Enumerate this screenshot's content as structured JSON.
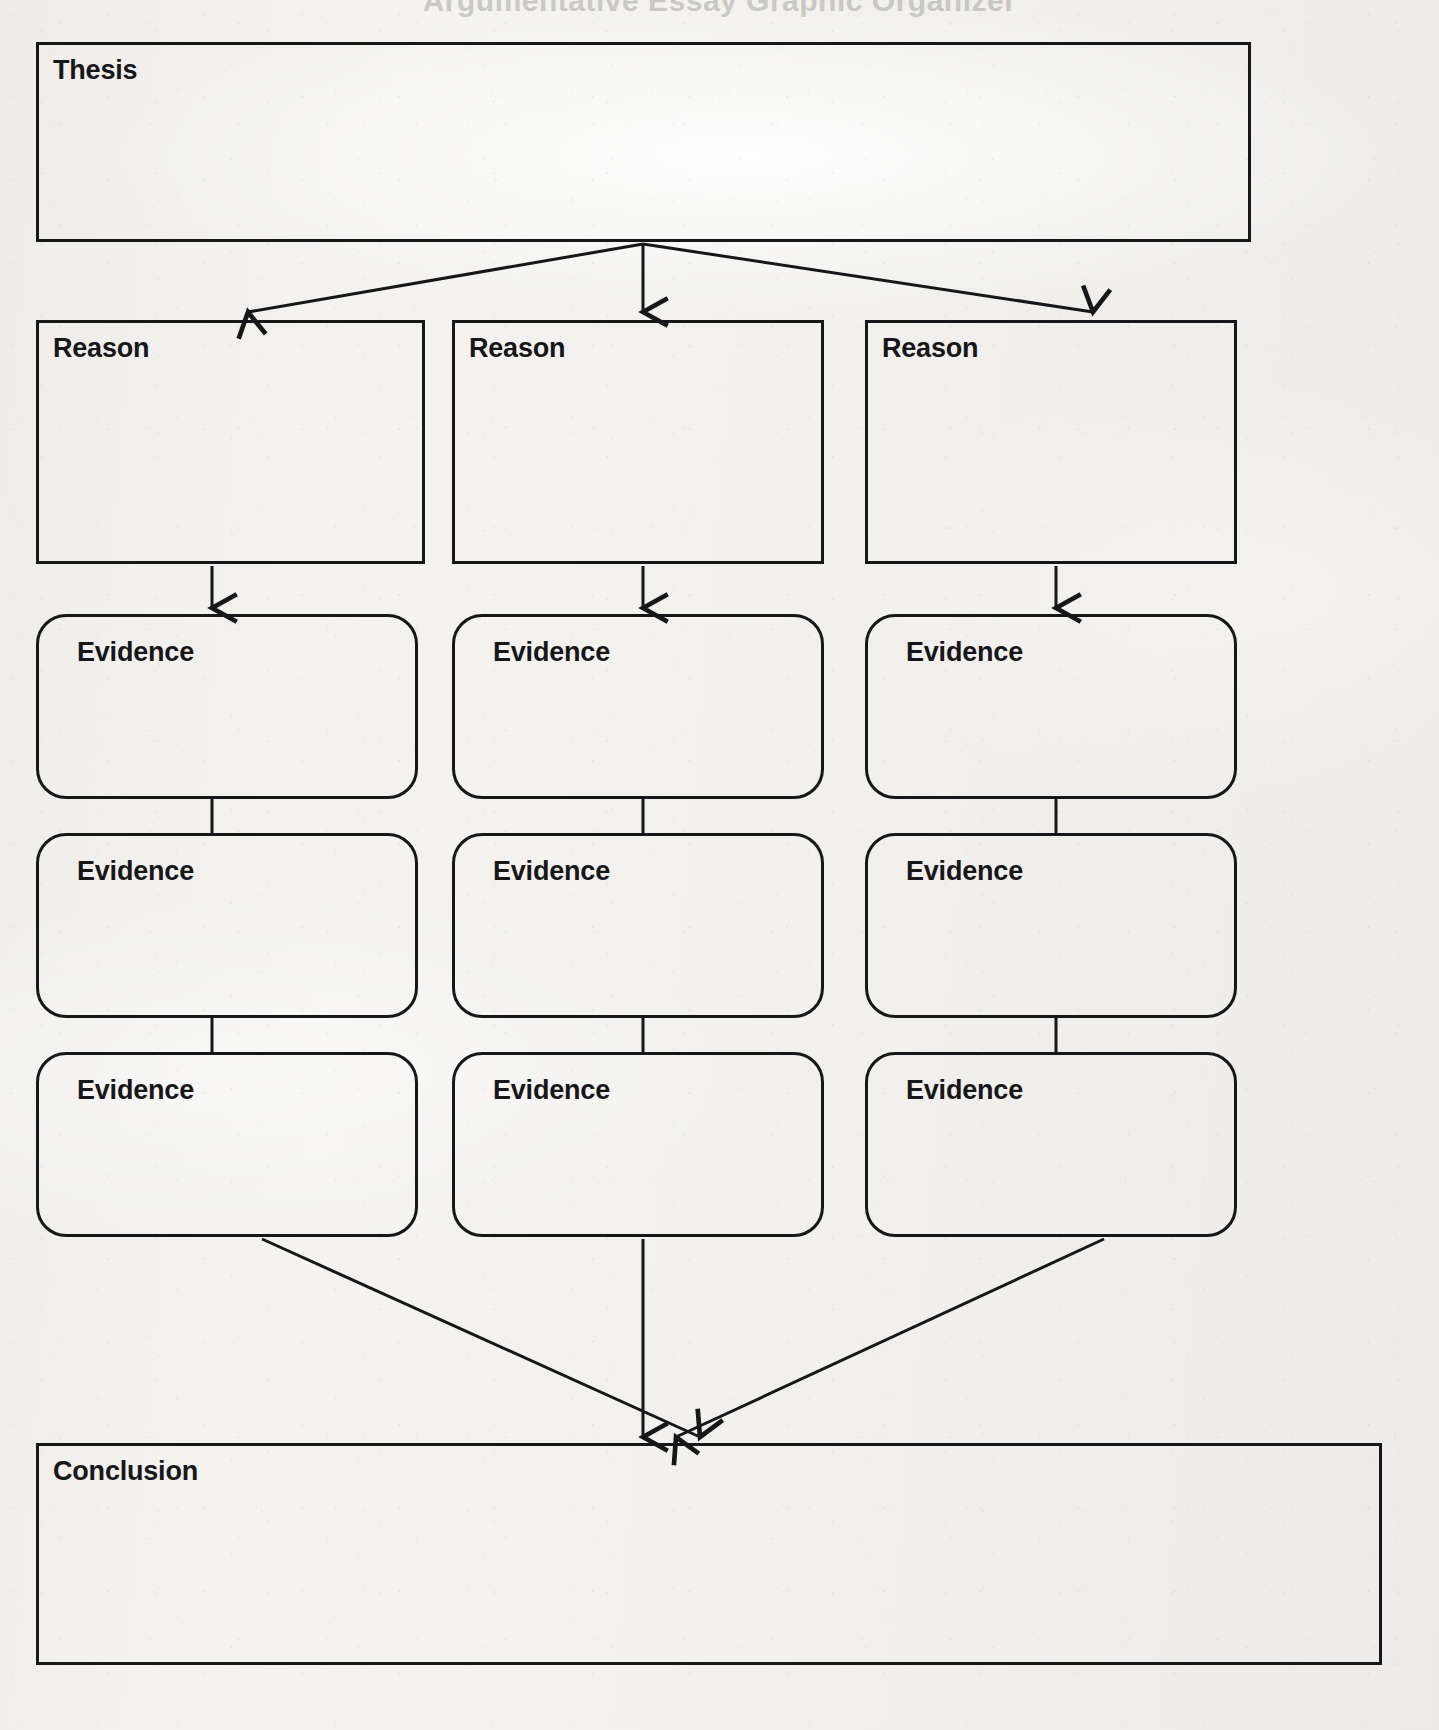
{
  "page": {
    "kind": "graphic-organizer-worksheet",
    "ghost_header_text": "Argumentative Essay Graphic Organizer",
    "ghost_margin_text": "",
    "paper_color": "#f2f1ee",
    "ink_color": "#17171a"
  },
  "diagram": {
    "title": "",
    "nodes": {
      "thesis": {
        "label": "Thesis",
        "shape": "rectangle"
      },
      "reasons": [
        {
          "label": "Reason",
          "shape": "rectangle"
        },
        {
          "label": "Reason",
          "shape": "rectangle"
        },
        {
          "label": "Reason",
          "shape": "rectangle"
        }
      ],
      "evidence_column_1": [
        {
          "label": "Evidence",
          "shape": "rounded-rectangle"
        },
        {
          "label": "Evidence",
          "shape": "rounded-rectangle"
        },
        {
          "label": "Evidence",
          "shape": "rounded-rectangle"
        }
      ],
      "evidence_column_2": [
        {
          "label": "Evidence",
          "shape": "rounded-rectangle"
        },
        {
          "label": "Evidence",
          "shape": "rounded-rectangle"
        },
        {
          "label": "Evidence",
          "shape": "rounded-rectangle"
        }
      ],
      "evidence_column_3": [
        {
          "label": "Evidence",
          "shape": "rounded-rectangle"
        },
        {
          "label": "Evidence",
          "shape": "rounded-rectangle"
        },
        {
          "label": "Evidence",
          "shape": "rounded-rectangle"
        }
      ],
      "conclusion": {
        "label": "Conclusion",
        "shape": "rectangle"
      }
    },
    "connectors": [
      {
        "name": "thesis-to-reason-1",
        "from": "thesis",
        "to": "reason-1",
        "arrowhead": true
      },
      {
        "name": "thesis-to-reason-2",
        "from": "thesis",
        "to": "reason-2",
        "arrowhead": true
      },
      {
        "name": "thesis-to-reason-3",
        "from": "thesis",
        "to": "reason-3",
        "arrowhead": true
      },
      {
        "name": "reason-1-to-evidence-1-1",
        "from": "reason-1",
        "to": "evidence-1-1",
        "arrowhead": true
      },
      {
        "name": "reason-2-to-evidence-2-1",
        "from": "reason-2",
        "to": "evidence-2-1",
        "arrowhead": true
      },
      {
        "name": "reason-3-to-evidence-3-1",
        "from": "reason-3",
        "to": "evidence-3-1",
        "arrowhead": true
      },
      {
        "name": "evidence-1-1-to-evidence-1-2",
        "from": "evidence-1-1",
        "to": "evidence-1-2",
        "arrowhead": false
      },
      {
        "name": "evidence-1-2-to-evidence-1-3",
        "from": "evidence-1-2",
        "to": "evidence-1-3",
        "arrowhead": false
      },
      {
        "name": "evidence-2-1-to-evidence-2-2",
        "from": "evidence-2-1",
        "to": "evidence-2-2",
        "arrowhead": false
      },
      {
        "name": "evidence-2-2-to-evidence-2-3",
        "from": "evidence-2-2",
        "to": "evidence-2-3",
        "arrowhead": false
      },
      {
        "name": "evidence-3-1-to-evidence-3-2",
        "from": "evidence-3-1",
        "to": "evidence-3-2",
        "arrowhead": false
      },
      {
        "name": "evidence-3-2-to-evidence-3-3",
        "from": "evidence-3-2",
        "to": "evidence-3-3",
        "arrowhead": false
      },
      {
        "name": "evidence-1-3-to-conclusion",
        "from": "evidence-1-3",
        "to": "conclusion",
        "arrowhead": true
      },
      {
        "name": "evidence-2-3-to-conclusion",
        "from": "evidence-2-3",
        "to": "conclusion",
        "arrowhead": true
      },
      {
        "name": "evidence-3-3-to-conclusion",
        "from": "evidence-3-3",
        "to": "conclusion",
        "arrowhead": true
      }
    ]
  }
}
